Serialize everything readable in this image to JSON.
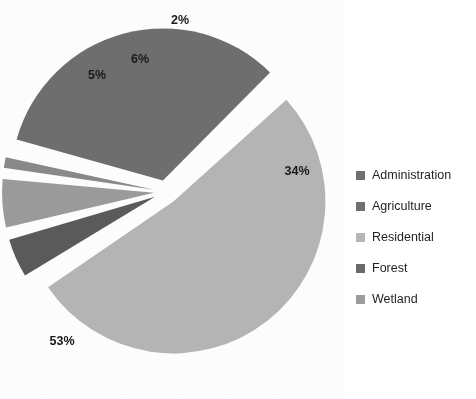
{
  "chart_data": {
    "type": "pie",
    "title": "",
    "categories": [
      "Administration",
      "Agriculture",
      "Residential",
      "Forest",
      "Wetland"
    ],
    "values": [
      34,
      53,
      6,
      5,
      2
    ],
    "value_labels": [
      "34%",
      "53%",
      "6%",
      "5%",
      "2%"
    ],
    "units": "percent",
    "exploded": true,
    "legend_position": "right",
    "grid": false,
    "colors": [
      "#6f6f6f",
      "#b6b6b6",
      "#9c9c9c",
      "#5b5b5b",
      "#8a8a8a"
    ],
    "slices": [
      {
        "label": "Administration",
        "value": 34,
        "display": "34%",
        "color": "#6f6f6f"
      },
      {
        "label": "Agriculture",
        "value": 53,
        "display": "53%",
        "color": "#b6b6b6"
      },
      {
        "label": "Residential",
        "value": 6,
        "display": "6%",
        "color": "#9c9c9c"
      },
      {
        "label": "Forest",
        "value": 5,
        "display": "5%",
        "color": "#5b5b5b"
      },
      {
        "label": "Wetland",
        "value": 2,
        "display": "2%",
        "color": "#8a8a8a"
      }
    ]
  },
  "labels": {
    "administration": "34%",
    "agriculture": "53%",
    "residential": "6%",
    "forest": "5%",
    "wetland": "2%"
  },
  "legend": {
    "items": [
      {
        "label": "Administration",
        "color": "#6f6f6f"
      },
      {
        "label": "Agriculture",
        "color": "#6f6f6f"
      },
      {
        "label": "Residential",
        "color": "#b6b6b6"
      },
      {
        "label": "Forest",
        "color": "#6a6a6a"
      },
      {
        "label": "Wetland",
        "color": "#9c9c9c"
      }
    ]
  },
  "background": "#ffffff"
}
